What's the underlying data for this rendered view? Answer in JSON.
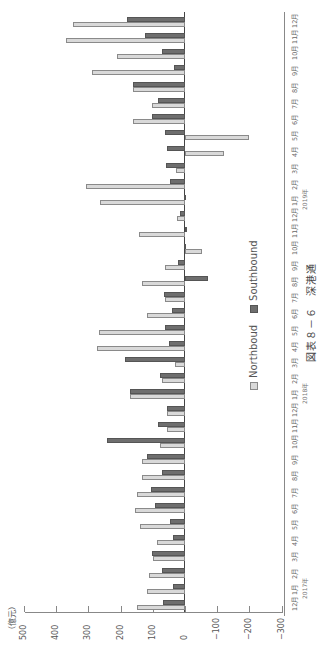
{
  "chart_data": {
    "type": "bar",
    "orientation": "rotated-90-ccw",
    "title": "図表８－６　深港通",
    "xlabel": "",
    "ylabel": "（億元）",
    "ylim": [
      -300,
      500
    ],
    "yticks": [
      500,
      400,
      300,
      200,
      100,
      0,
      -100,
      -200,
      -300
    ],
    "grid": false,
    "legend_position": "center-right",
    "categories": [
      "12月",
      "1月",
      "2月",
      "3月",
      "4月",
      "5月",
      "6月",
      "7月",
      "8月",
      "9月",
      "10月",
      "11月",
      "12月",
      "1月",
      "2月",
      "3月",
      "4月",
      "5月",
      "6月",
      "7月",
      "8月",
      "9月",
      "10月",
      "11月",
      "12月",
      "1月",
      "2月",
      "3月",
      "4月",
      "5月",
      "6月",
      "7月",
      "8月",
      "9月",
      "10月",
      "11月",
      "12月"
    ],
    "year_labels": [
      {
        "label": "2017年",
        "index": 1
      },
      {
        "label": "2018年",
        "index": 13
      },
      {
        "label": "2019年",
        "index": 25
      }
    ],
    "series": [
      {
        "name": "Northboud",
        "color": "#d9d9d9",
        "values": [
          150,
          118,
          112,
          99,
          87,
          140,
          155,
          149,
          134,
          134,
          78,
          56,
          56,
          170,
          70,
          31,
          272,
          266,
          117,
          61,
          133,
          61,
          -52,
          142,
          24,
          264,
          308,
          29,
          -122,
          -200,
          160,
          104,
          160,
          288,
          210,
          371,
          347
        ]
      },
      {
        "name": "Southbound",
        "color": "#6e6e6e",
        "values": [
          68,
          37,
          71,
          102,
          37,
          47,
          93,
          106,
          71,
          118,
          242,
          84,
          56,
          171,
          78,
          186,
          51,
          61,
          39,
          64,
          -70,
          21,
          3,
          -1,
          16,
          2,
          47,
          59,
          57,
          62,
          101,
          83,
          160,
          33,
          70,
          124,
          179
        ]
      }
    ]
  },
  "labels": {
    "unit": "（億元）",
    "title": "図表８－６　深港通",
    "legend_north": "Northboud",
    "legend_south": "Southbound"
  }
}
